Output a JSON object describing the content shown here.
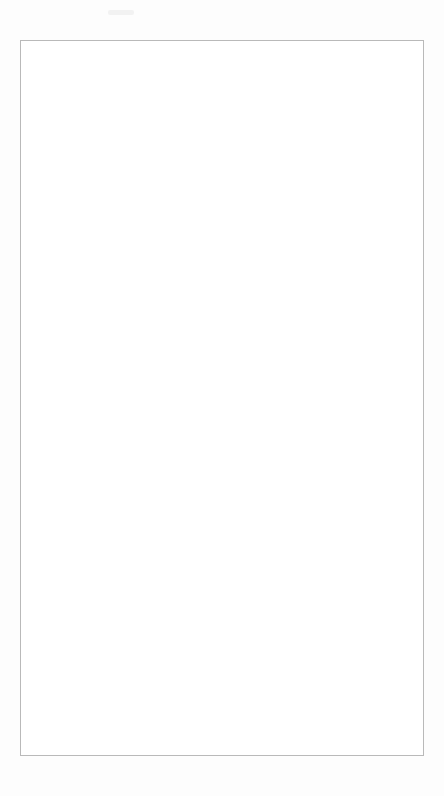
{
  "document": {
    "page_background": "#fdfdfd",
    "frame_color": "#b9b9b9"
  },
  "chart_data": {
    "type": "line",
    "title": "Ratio of Corticosteroid to Bronchodilator Prescribing",
    "xlabel": "Month",
    "ylabel": "Ratio",
    "ylim": [
      0.0,
      1.0
    ],
    "ytick_labels": [
      "0.00",
      "0.10",
      "0.20",
      "0.30",
      "0.40",
      "0.50",
      "0.60",
      "0.70",
      "0.80",
      "0.90",
      "1.00"
    ],
    "ytick_values": [
      0.0,
      0.1,
      0.2,
      0.3,
      0.4,
      0.5,
      0.6,
      0.7,
      0.8,
      0.9,
      1.0
    ],
    "grid": false,
    "legend_position": "top-right",
    "categories": [
      "Jan-94",
      "Feb-94",
      "Mar-94",
      "Apr-94",
      "May-94",
      "Jun-94",
      "Jul-94",
      "Aug-94",
      "Sep-94",
      "Oct-94",
      "Nov-94",
      "Dec-94",
      "Jan-95",
      "Feb-95",
      "Mar-95",
      "Apr-95",
      "May-95",
      "Jun-95",
      "Jul-95",
      "Aug-95",
      "Sep-95",
      "Oct-95",
      "Nov-95",
      "Dec-95",
      "Jan-96",
      "Feb-96",
      "Mar-96",
      "Apr-96",
      "May-96",
      "Jun-96"
    ],
    "xtick_labels": [
      "J\nan-\n94",
      "M\nar-\n94",
      "M\nay-\n94",
      "Jul-\n94",
      "S\nep-\n94",
      "N\nov-\n94",
      "J\nan-\n95",
      "M\nar-\n95",
      "M\nay-\n95",
      "Jul-\n95",
      "S\nep-\n95",
      "N\nov-\n95",
      "J\nan-\n96",
      "M\nar-\n96",
      "M\nay-\n96"
    ],
    "xtick_labels_flat": [
      "Jan-94",
      "Mar-94",
      "May-94",
      "Jul-94",
      "Sep-94",
      "Nov-94",
      "Jan-95",
      "Mar-95",
      "May-95",
      "Jul-95",
      "Sep-95",
      "Nov-95",
      "Jan-96",
      "Mar-96",
      "May-96"
    ],
    "series": [
      {
        "name": "Practice",
        "marker": "open-square",
        "marker_fill": "#a9a9a9",
        "line_color": "#1a1a1a",
        "values": [
          0.14,
          0.21,
          0.13,
          0.11,
          0.09,
          0.095,
          0.12,
          0.135,
          0.165,
          0.19,
          0.205,
          0.19,
          0.23,
          0.265,
          0.295,
          0.37,
          0.28,
          0.21,
          0.4,
          0.165,
          0.445,
          0.3,
          0.265,
          0.425,
          0.335,
          0.33,
          0.52,
          0.455,
          0.59,
          0.49
        ]
      },
      {
        "name": "LSLHA",
        "marker": "filled-diamond",
        "marker_fill": "#101010",
        "line_color": "#101010",
        "values": [
          0.365,
          0.38,
          0.375,
          0.385,
          0.375,
          0.38,
          0.385,
          0.385,
          0.385,
          0.39,
          0.385,
          0.375,
          0.39,
          0.39,
          0.385,
          0.405,
          0.4,
          0.4,
          0.405,
          0.41,
          0.415,
          0.41,
          0.415,
          0.425,
          0.435,
          0.445,
          0.455,
          0.47,
          0.52,
          0.47
        ]
      }
    ],
    "legend": [
      {
        "label": "Practice",
        "marker": "open-square"
      },
      {
        "label": "LSLHA",
        "marker": "filled-diamond"
      }
    ]
  }
}
